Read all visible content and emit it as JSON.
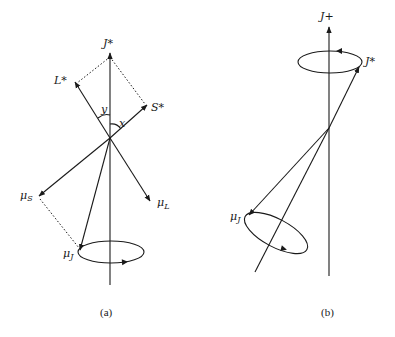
{
  "diagram": {
    "panel_a": {
      "caption": "(a)",
      "labels": {
        "j_star": "J*",
        "l_star": "L*",
        "s_star": "S*",
        "angle_y": "y",
        "angle_x": "x",
        "mu_s": "μ",
        "mu_s_sub": "S",
        "mu_l": "μ",
        "mu_l_sub": "L",
        "mu_j": "μ",
        "mu_j_sub": "J"
      }
    },
    "panel_b": {
      "caption": "(b)",
      "labels": {
        "j_plus": "J+",
        "j_star": "J*",
        "mu_j": "μ",
        "mu_j_sub": "J"
      }
    },
    "colors": {
      "ink": "#1a1a1a",
      "background": "#ffffff"
    }
  }
}
